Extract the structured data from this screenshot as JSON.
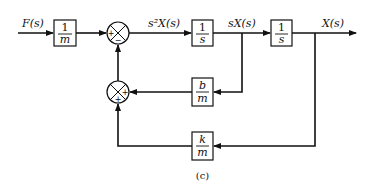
{
  "diagram": {
    "type": "block-diagram",
    "caption": "(c)",
    "signals": {
      "input": "F(s)",
      "accel": "s²X(s)",
      "velocity": "sX(s)",
      "output": "X(s)"
    },
    "blocks": {
      "gain_m": {
        "num": "1",
        "den": "m"
      },
      "integrator1": {
        "num": "1",
        "den": "s"
      },
      "integrator2": {
        "num": "1",
        "den": "s"
      },
      "damping": {
        "num": "b",
        "den": "m"
      },
      "spring": {
        "num": "k",
        "den": "m"
      }
    },
    "junctions": {
      "main": {
        "left_sign": "+",
        "bottom_sign": "−"
      },
      "feedback": {
        "right_sign": "+",
        "bottom_sign": "+"
      }
    },
    "colors": {
      "line": "#111111",
      "background": "#ffffff"
    }
  }
}
